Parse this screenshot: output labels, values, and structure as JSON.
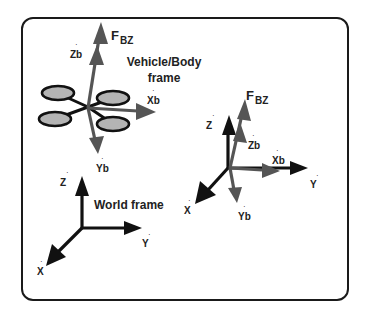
{
  "diagram": {
    "title_vehicle_line1": "Vehicle/Body",
    "title_vehicle_line2": "frame",
    "title_world": "World frame",
    "colors": {
      "frame_border": "#1a1a1a",
      "world_axes": "#111111",
      "body_axes": "#555555",
      "propeller_fill": "#b4b4b4",
      "propeller_stroke": "#111111",
      "background": "#ffffff"
    },
    "vehicle_frame": {
      "force_label_main": "F",
      "force_label_sub": "BZ",
      "axis_labels": {
        "zb": "Zb",
        "xb": "Xb",
        "yb": "Yb"
      }
    },
    "world_frame": {
      "axis_labels": {
        "z": "Z",
        "y": "Y",
        "x": "X"
      }
    },
    "combined_frame": {
      "force_label_main": "F",
      "force_label_sub": "BZ",
      "axis_labels": {
        "z": "Z",
        "zb": "Zb",
        "xb": "Xb",
        "y": "Y",
        "x": "X",
        "yb": "Yb"
      }
    }
  }
}
